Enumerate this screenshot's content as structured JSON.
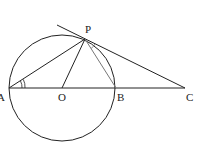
{
  "header_fragment": "",
  "diagram": {
    "points": {
      "A": {
        "label": "A",
        "x": 9,
        "y": 88
      },
      "O": {
        "label": "O",
        "x": 62,
        "y": 88
      },
      "B": {
        "label": "B",
        "x": 116,
        "y": 88
      },
      "C": {
        "label": "C",
        "x": 185,
        "y": 88
      },
      "P": {
        "label": "P",
        "x": 85,
        "y": 39
      }
    },
    "circle": {
      "center": "O",
      "radius": 53
    },
    "segments": [
      "AC",
      "AP",
      "OP",
      "PB",
      "PC"
    ],
    "tangent_line": {
      "from": [
        57,
        25
      ],
      "to": [
        185,
        88
      ]
    },
    "angle_marks": [
      "PAB",
      "BPC"
    ],
    "colors": {
      "stroke": "#222222",
      "chord_pb": "#777777"
    }
  }
}
